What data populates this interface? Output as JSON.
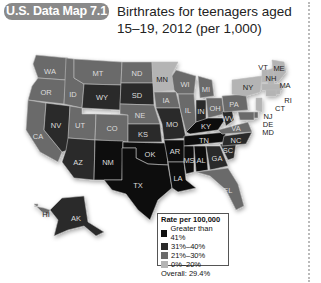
{
  "header": {
    "badge": "U.S. Data Map 7.1",
    "title": "Birthrates for teenagers aged 15–19, 2012 (per 1,000)"
  },
  "colors": {
    "c1": "#111111",
    "c2": "#2a2a2a",
    "c3": "#6b6b6b",
    "c4": "#b4b4b4"
  },
  "legend": {
    "title": "Rate per 100,000",
    "items": [
      {
        "label": "Greater than 41%",
        "color": "#111111"
      },
      {
        "label": "31%–40%",
        "color": "#2a2a2a"
      },
      {
        "label": "21%–30%",
        "color": "#6b6b6b"
      },
      {
        "label": "0%–20%",
        "color": "#b4b4b4"
      }
    ],
    "overall": "Overall: 29.4%"
  },
  "states": {
    "WA": "21%–30%",
    "OR": "21%–30%",
    "CA": "21%–30%",
    "NV": "31%–40%",
    "ID": "21%–30%",
    "MT": "21%–30%",
    "WY": "31%–40%",
    "UT": "21%–30%",
    "CO": "21%–30%",
    "AZ": "31%–40%",
    "NM": "Greater than 41%",
    "ND": "21%–30%",
    "SD": "31%–40%",
    "NE": "21%–30%",
    "KS": "31%–40%",
    "OK": "Greater than 41%",
    "TX": "Greater than 41%",
    "MN": "0%–20%",
    "IA": "21%–30%",
    "MO": "31%–40%",
    "AR": "Greater than 41%",
    "LA": "Greater than 41%",
    "WI": "21%–30%",
    "IL": "21%–30%",
    "MI": "21%–30%",
    "IN": "31%–40%",
    "OH": "21%–30%",
    "KY": "Greater than 41%",
    "TN": "Greater than 41%",
    "MS": "Greater than 41%",
    "AL": "Greater than 41%",
    "GA": "31%–40%",
    "FL": "21%–30%",
    "SC": "31%–40%",
    "NC": "31%–40%",
    "VA": "21%–30%",
    "WV": "31%–40%",
    "PA": "21%–30%",
    "NY": "0%–20%",
    "VT": "0%–20%",
    "NH": "0%–20%",
    "ME": "0%–20%",
    "MA": "0%–20%",
    "RI": "0%–20%",
    "CT": "0%–20%",
    "NJ": "0%–20%",
    "DE": "21%–30%",
    "MD": "21%–30%",
    "AK": "31%–40%",
    "HI": "21%–30%"
  }
}
